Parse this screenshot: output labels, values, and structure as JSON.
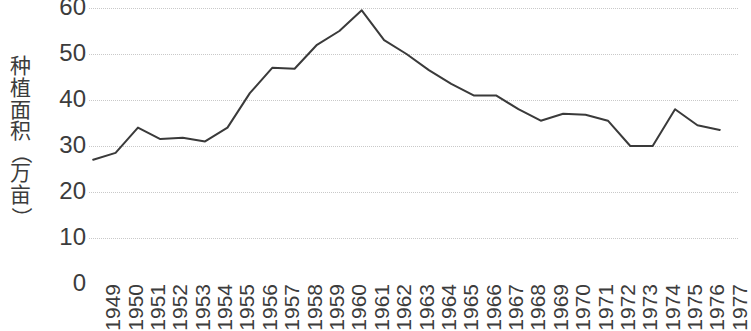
{
  "chart_data": {
    "type": "line",
    "title": "",
    "xlabel": "",
    "ylabel": "种植面积（万亩）",
    "ylabel_chars": [
      "种",
      "植",
      "面",
      "积",
      "（",
      "万",
      "亩",
      "）"
    ],
    "ylim": [
      0,
      60
    ],
    "yticks": [
      0,
      10,
      20,
      30,
      40,
      50,
      60
    ],
    "ytick_labels": [
      "0",
      "10",
      "20",
      "30",
      "40",
      "50",
      "60"
    ],
    "grid": true,
    "grid_axis": "y",
    "grid_style": "dotted",
    "grid_color": "#c9c9c9",
    "legend": null,
    "line_color": "#3a3a3a",
    "line_width": 2,
    "markers": false,
    "background_color": "#ffffff",
    "categories": [
      "1949",
      "1950",
      "1951",
      "1952",
      "1953",
      "1954",
      "1955",
      "1956",
      "1957",
      "1958",
      "1959",
      "1960",
      "1961",
      "1962",
      "1963",
      "1964",
      "1965",
      "1966",
      "1967",
      "1968",
      "1969",
      "1970",
      "1971",
      "1972",
      "1973",
      "1974",
      "1975",
      "1976",
      "1977"
    ],
    "values": [
      27.0,
      28.5,
      34.0,
      31.5,
      31.8,
      31.0,
      34.0,
      41.5,
      47.0,
      46.8,
      52.0,
      55.0,
      59.5,
      53.0,
      50.0,
      46.5,
      43.5,
      41.0,
      41.0,
      38.0,
      35.5,
      37.0,
      36.8,
      35.5,
      30.0,
      30.0,
      38.0,
      34.5,
      33.5
    ]
  }
}
